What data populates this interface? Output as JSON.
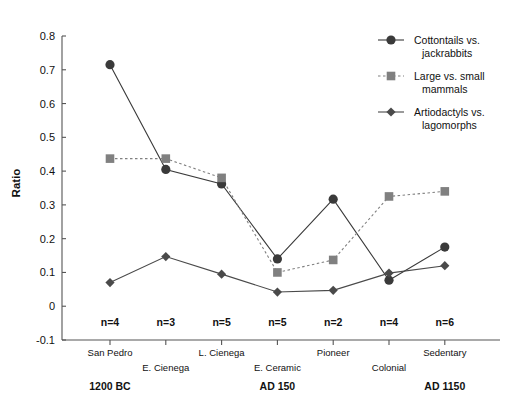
{
  "chart_data": {
    "type": "line",
    "title": "",
    "xlabel": "",
    "ylabel": "Ratio",
    "ylim": [
      -0.1,
      0.8
    ],
    "ytick_labels": [
      "0.8",
      "0.7",
      "0.6",
      "0.5",
      "0.4",
      "0.3",
      "0.2",
      "0.1",
      "0",
      "-0.1"
    ],
    "ytick_values": [
      0.8,
      0.7,
      0.6,
      0.5,
      0.4,
      0.3,
      0.2,
      0.1,
      0,
      -0.1
    ],
    "grid": false,
    "legend_position": "top-right",
    "categories": [
      "San Pedro",
      "E. Cienega",
      "L. Cienega",
      "E. Ceramic",
      "Pioneer",
      "Colonial",
      "Sedentary"
    ],
    "sample_sizes": [
      "n=4",
      "n=3",
      "n=5",
      "n=5",
      "n=2",
      "n=4",
      "n=6"
    ],
    "era_labels": [
      {
        "text": "1200 BC",
        "category": "San Pedro"
      },
      {
        "text": "AD 150",
        "category": "E. Ceramic"
      },
      {
        "text": "AD 1150",
        "category": "Sedentary"
      }
    ],
    "series": [
      {
        "name": "Cottontails vs. jackrabbits",
        "marker": "circle",
        "linestyle": "solid",
        "color": "#3a3a3a",
        "values": [
          0.715,
          0.405,
          0.362,
          0.14,
          0.317,
          0.077,
          0.175
        ]
      },
      {
        "name": "Large vs. small mammals",
        "marker": "square",
        "linestyle": "dotted",
        "color": "#808080",
        "values": [
          0.437,
          0.437,
          0.38,
          0.1,
          0.137,
          0.325,
          0.34
        ]
      },
      {
        "name": "Artiodactyls vs. lagomorphs",
        "marker": "diamond",
        "linestyle": "solid",
        "color": "#4a4a4a",
        "values": [
          0.07,
          0.147,
          0.095,
          0.042,
          0.047,
          0.098,
          0.12
        ]
      }
    ]
  },
  "legend": {
    "items": [
      {
        "label_line1": "Cottontails vs.",
        "label_line2": "jackrabbits"
      },
      {
        "label_line1": "Large vs. small",
        "label_line2": "mammals"
      },
      {
        "label_line1": "Artiodactyls vs.",
        "label_line2": "lagomorphs"
      }
    ]
  },
  "colors": {
    "circle_series": "#3a3a3a",
    "square_series": "#808080",
    "diamond_series": "#4a4a4a",
    "axis": "#555555",
    "text": "#111111",
    "background": "#ffffff"
  }
}
